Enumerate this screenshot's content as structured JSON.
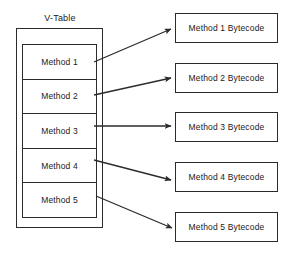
{
  "diagram": {
    "title": "V-Table",
    "vtable": {
      "label": "V-Table",
      "rows": [
        {
          "label": "Method 1"
        },
        {
          "label": "Method 2"
        },
        {
          "label": "Method 3"
        },
        {
          "label": "Method 4"
        },
        {
          "label": "Method 5"
        }
      ]
    },
    "bytecode_boxes": [
      {
        "label": "Method 1 Bytecode"
      },
      {
        "label": "Method 2 Bytecode"
      },
      {
        "label": "Method 3 Bytecode"
      },
      {
        "label": "Method 4 Bytecode"
      },
      {
        "label": "Method 5 Bytecode"
      }
    ],
    "arrows": [
      {
        "name": "arrow-method-1",
        "from": "Method 1",
        "to": "Method 1 Bytecode"
      },
      {
        "name": "arrow-method-2",
        "from": "Method 2",
        "to": "Method 2 Bytecode"
      },
      {
        "name": "arrow-method-3",
        "from": "Method 3",
        "to": "Method 3 Bytecode"
      },
      {
        "name": "arrow-method-4",
        "from": "Method 4",
        "to": "Method 4 Bytecode"
      },
      {
        "name": "arrow-method-5",
        "from": "Method 5",
        "to": "Method 5 Bytecode"
      }
    ],
    "colors": {
      "stroke": "#2b2b2b",
      "text": "#1a1a1a",
      "background": "#ffffff"
    }
  }
}
